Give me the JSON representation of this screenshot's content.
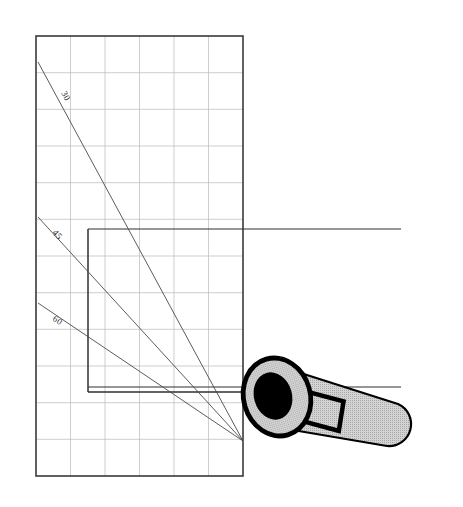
{
  "figure": {
    "canvas": {
      "width": 463,
      "height": 507,
      "background": "#ffffff"
    },
    "grid_panel": {
      "name": "main-grid-rectangle",
      "x": 36,
      "y": 36,
      "width": 207,
      "height": 440,
      "border_color": "#3a3a3a",
      "border_width": 1.6,
      "grid_color": "#b9b9b9",
      "grid_width": 0.7,
      "columns": 6,
      "rows": 12,
      "cell_width": 34.5,
      "cell_height": 36.7
    },
    "inner_rectangle": {
      "name": "inner-reference-rectangle",
      "x": 88,
      "y": 229,
      "width": 155,
      "height": 163,
      "border_color": "#2f2f2f",
      "border_width": 1.5
    },
    "extension_lines": [
      {
        "name": "upper-extension-line",
        "x1": 88,
        "y1": 229,
        "x2": 401,
        "y2": 229,
        "color": "#2f2f2f",
        "width": 1.2
      },
      {
        "name": "lower-extension-line",
        "x1": 88,
        "y1": 387,
        "x2": 401,
        "y2": 387,
        "color": "#2f2f2f",
        "width": 1.2
      }
    ],
    "convergence_point": {
      "x": 243,
      "y": 441
    },
    "angle_lines": [
      {
        "name": "angle-line-30",
        "label": "30",
        "x1": 38,
        "y1": 62,
        "x2": 243,
        "y2": 441,
        "color": "#4a4a4a",
        "width": 0.9,
        "label_x": 61,
        "label_y": 93,
        "label_rotation": 62
      },
      {
        "name": "angle-line-45",
        "label": "45",
        "x1": 38,
        "y1": 217,
        "x2": 243,
        "y2": 441,
        "color": "#4a4a4a",
        "width": 0.9,
        "label_x": 54,
        "label_y": 232,
        "label_rotation": 48
      },
      {
        "name": "angle-line-60",
        "label": "60",
        "x1": 38,
        "y1": 303,
        "x2": 243,
        "y2": 441,
        "color": "#4a4a4a",
        "width": 0.9,
        "label_x": 54,
        "label_y": 317,
        "label_rotation": 34
      }
    ],
    "tool": {
      "name": "ratchet-wrench",
      "head_center": {
        "x": 277,
        "y": 397
      },
      "head_rx": 35,
      "head_ry": 40,
      "head_rotation": -17,
      "outline_color": "#000000",
      "body_fill": "#c9c9c9",
      "socket_fill": "#000000",
      "socket_rx": 20,
      "socket_ry": 25,
      "handle_fill": "#c9c9c9",
      "handle_end": {
        "x": 410,
        "y": 430
      },
      "slot_label": "square-drive-slot"
    }
  }
}
